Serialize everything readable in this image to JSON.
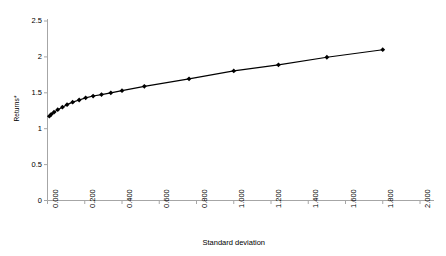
{
  "chart_data": {
    "type": "line",
    "title": "",
    "subtitle": "",
    "xlabel": "Standard deviation",
    "ylabel": "Returns*",
    "xlim": [
      0.0,
      2.0
    ],
    "ylim": [
      0.0,
      2.5
    ],
    "grid": false,
    "legend": "none",
    "marker": "filled-diamond",
    "line_color": "#000000",
    "marker_color": "#000000",
    "axis_color": "#a6a6a6",
    "background_color": "#ffffff",
    "xticks": [
      "0.000",
      "0.200",
      "0.400",
      "0.600",
      "0.800",
      "1.000",
      "1.200",
      "1.400",
      "1.600",
      "1.800",
      "2.000"
    ],
    "xtick_values": [
      0.0,
      0.2,
      0.4,
      0.6,
      0.8,
      1.0,
      1.2,
      1.4,
      1.6,
      1.8,
      2.0
    ],
    "yticks": [
      "0",
      "0.5",
      "1",
      "1.5",
      "2",
      "2.5"
    ],
    "ytick_values": [
      0,
      0.5,
      1,
      1.5,
      2,
      2.5
    ],
    "series": [
      {
        "name": "Efficient frontier",
        "x": [
          0.01,
          0.02,
          0.035,
          0.055,
          0.08,
          0.105,
          0.135,
          0.17,
          0.205,
          0.245,
          0.29,
          0.34,
          0.4,
          0.52,
          0.76,
          1.0,
          1.24,
          1.5,
          1.8
        ],
        "y": [
          1.175,
          1.2,
          1.23,
          1.265,
          1.3,
          1.335,
          1.37,
          1.4,
          1.43,
          1.455,
          1.475,
          1.5,
          1.53,
          1.59,
          1.695,
          1.805,
          1.89,
          1.995,
          2.1
        ]
      }
    ]
  }
}
